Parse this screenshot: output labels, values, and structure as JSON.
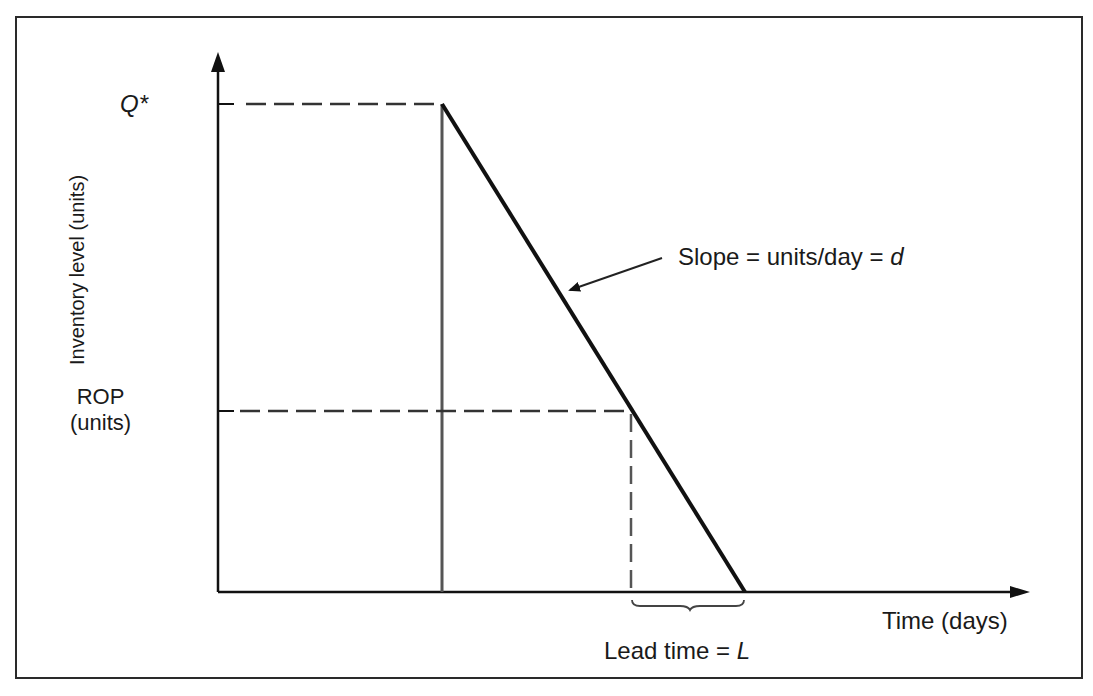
{
  "diagram": {
    "type": "inventory-reorder-point-model",
    "axes": {
      "y_label": "Inventory level (units)",
      "x_label": "Time (days)"
    },
    "labels": {
      "q_star": "Q*",
      "rop_line1": "ROP",
      "rop_line2": "(units)",
      "slope": "Slope = units/day = ",
      "slope_var": "d",
      "lead_time": "Lead time = ",
      "lead_var": "L"
    },
    "colors": {
      "line": "#111111",
      "dashed": "#333333",
      "frame": "#2a2a2a",
      "background": "#ffffff"
    }
  }
}
